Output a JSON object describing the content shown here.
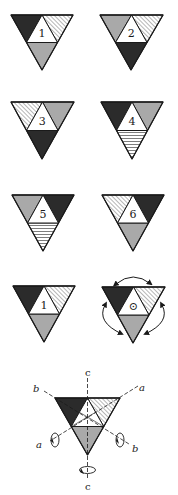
{
  "colors": {
    "dark": "#2b2b2b",
    "gray": "#a9a9a9",
    "white": "#ffffff",
    "outline": "#1a1a1a",
    "hatch": "#6e6e6e",
    "stripe": "#6e6e6e"
  },
  "fill_legend": {
    "dark": "solid dark face",
    "gray": "solid gray face",
    "diag": "diagonally hatched face",
    "horiz": "horizontally striped face",
    "center": "white center face"
  },
  "pieces": [
    {
      "label": "1",
      "faces": {
        "left": "dark",
        "right": "diag",
        "bottom": "gray"
      }
    },
    {
      "label": "2",
      "faces": {
        "left": "gray",
        "right": "diag",
        "bottom": "dark"
      }
    },
    {
      "label": "3",
      "faces": {
        "left": "diag",
        "right": "gray",
        "bottom": "dark"
      }
    },
    {
      "label": "4",
      "faces": {
        "left": "dark",
        "right": "gray",
        "bottom": "horiz"
      }
    },
    {
      "label": "5",
      "faces": {
        "left": "gray",
        "right": "dark",
        "bottom": "horiz"
      }
    },
    {
      "label": "6",
      "faces": {
        "left": "diag",
        "right": "dark",
        "bottom": "gray"
      }
    },
    {
      "label": "1",
      "faces": {
        "left": "dark",
        "right": "diag",
        "bottom": "gray"
      }
    },
    {
      "label": "⊙",
      "faces": {
        "left": "dark",
        "right": "diag",
        "bottom": "gray"
      },
      "rotation_arrows": true
    }
  ],
  "axes_diagram": {
    "faces": {
      "left": "dark",
      "right": "diag",
      "bottom": "gray"
    },
    "axes": [
      {
        "name": "c",
        "label_top": "c",
        "label_bottom": "c"
      },
      {
        "name": "a",
        "label_end1": "a",
        "label_end2": "a"
      },
      {
        "name": "b",
        "label_end1": "b",
        "label_end2": "b"
      }
    ]
  }
}
